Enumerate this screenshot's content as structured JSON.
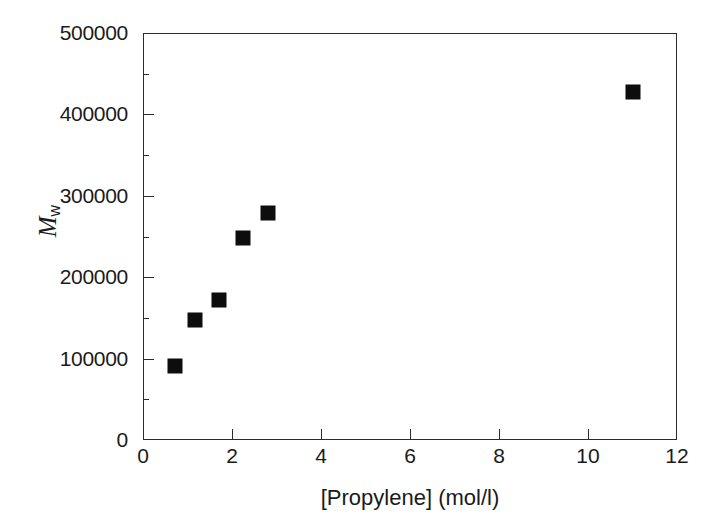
{
  "chart_data": {
    "type": "scatter",
    "title": "",
    "xlabel": "[Propylene] (mol/l)",
    "ylabel": "Mw",
    "ylabel_parts": {
      "symbol": "M",
      "subscript": "w"
    },
    "xlim": [
      0,
      12
    ],
    "ylim": [
      0,
      500000
    ],
    "grid": false,
    "legend": null,
    "marker": {
      "shape": "square",
      "color": "#0d0d0d",
      "filled": true,
      "size_px": 15
    },
    "frame_color": "#2b2b2b",
    "background": "#ffffff",
    "xticks": [
      0,
      2,
      4,
      6,
      8,
      10,
      12
    ],
    "xtick_labels": [
      "0",
      "2",
      "4",
      "6",
      "8",
      "10",
      "12"
    ],
    "yticks_major": [
      0,
      100000,
      200000,
      300000,
      400000,
      500000
    ],
    "ytick_labels": [
      "0",
      "100000",
      "200000",
      "300000",
      "400000",
      "500000"
    ],
    "yticks_minor": [
      50000,
      150000,
      250000,
      350000,
      450000
    ],
    "series": [
      {
        "name": "Mw vs propylene concentration",
        "points": [
          {
            "x": 0.72,
            "y": 91000
          },
          {
            "x": 1.17,
            "y": 148000
          },
          {
            "x": 1.7,
            "y": 172000
          },
          {
            "x": 2.25,
            "y": 248000
          },
          {
            "x": 2.8,
            "y": 279000
          },
          {
            "x": 11.0,
            "y": 427000
          }
        ]
      }
    ]
  }
}
